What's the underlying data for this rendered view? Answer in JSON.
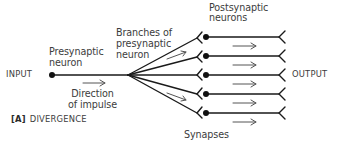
{
  "figure": {
    "panel_tag": "[A]",
    "title": "DIVERGENCE"
  },
  "labels": {
    "input": "INPUT",
    "output": "OUTPUT",
    "presynaptic_neuron": [
      "Presynaptic",
      "neuron"
    ],
    "branches": [
      "Branches of",
      "presynaptic",
      "neuron"
    ],
    "postsynaptic_neurons": [
      "Postsynaptic",
      "neurons"
    ],
    "direction": [
      "Direction",
      "of impulse"
    ],
    "synapses": "Synapses"
  },
  "structure": {
    "presynaptic_neuron_count": 1,
    "branch_count": 5,
    "postsynaptic_neuron_count": 5,
    "synapse_count": 5,
    "flow_direction": "left-to-right"
  },
  "colors": {
    "line": "#1a1a1a",
    "arrow": "#555555",
    "text": "#3c3c3c",
    "background": "#ffffff"
  }
}
